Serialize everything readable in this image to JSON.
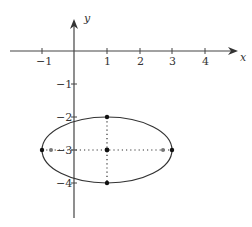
{
  "diagram": {
    "title": "",
    "axes": {
      "x_label": "x",
      "y_label": "y",
      "x_ticks": [
        {
          "value": -1,
          "label": "−1"
        },
        {
          "value": 1,
          "label": "1"
        },
        {
          "value": 2,
          "label": "2"
        },
        {
          "value": 3,
          "label": "3"
        },
        {
          "value": 4,
          "label": "4"
        }
      ],
      "y_ticks": [
        {
          "value": -1,
          "label": "−1"
        },
        {
          "value": -2,
          "label": "−2"
        },
        {
          "value": -3,
          "label": "−3"
        },
        {
          "value": -4,
          "label": "−4"
        }
      ]
    },
    "ellipse": {
      "center": [
        1,
        -3
      ],
      "semi_major_axis": 2,
      "semi_minor_axis": 1,
      "orientation": "horizontal",
      "vertices": [
        [
          -1,
          -3
        ],
        [
          3,
          -3
        ]
      ],
      "co_vertices": [
        [
          1,
          -2
        ],
        [
          1,
          -4
        ]
      ],
      "foci": [
        [
          -0.73,
          -3
        ],
        [
          2.73,
          -3
        ]
      ]
    },
    "colors": {
      "stroke": "#333333",
      "background": "#ffffff"
    }
  }
}
